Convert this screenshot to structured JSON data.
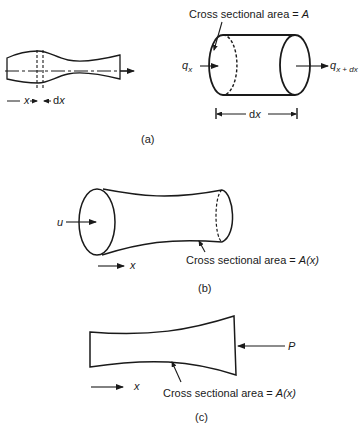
{
  "figure": {
    "panel_a": {
      "caption": "(a)",
      "bar": {
        "label_x": "x",
        "label_dx": "dx"
      },
      "element": {
        "area_label": "Cross sectional area = ",
        "area_symbol": "A",
        "flux_in": "q",
        "flux_in_sub": "x",
        "flux_out": "q",
        "flux_out_sub": "x + dx",
        "length_label": "dx"
      }
    },
    "panel_b": {
      "caption": "(b)",
      "input_label": "u",
      "axis_label": "x",
      "area_label": "Cross sectional area = ",
      "area_symbol": "A(x)"
    },
    "panel_c": {
      "caption": "(c)",
      "load_label": "P",
      "axis_label": "x",
      "area_label": "Cross sectional area = ",
      "area_symbol": "A(x)"
    }
  }
}
